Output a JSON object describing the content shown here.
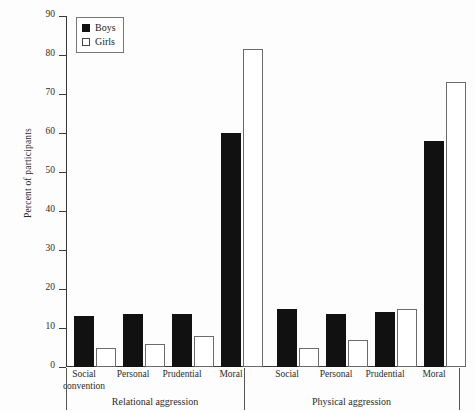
{
  "chart_data": {
    "type": "bar",
    "title": "",
    "xlabel": "",
    "ylabel": "Percent of participants",
    "ylim": [
      0,
      90
    ],
    "yticks": [
      0,
      10,
      20,
      30,
      40,
      50,
      60,
      70,
      80,
      90
    ],
    "grid": false,
    "legend_position": "top-left",
    "categories": [
      "Social convention",
      "Personal",
      "Prudential",
      "Moral",
      "Social convention",
      "Personal",
      "Prudential",
      "Moral"
    ],
    "group_labels": [
      "Relational aggression",
      "Physical aggression"
    ],
    "series": [
      {
        "name": "Boys",
        "color": "#111111",
        "values": [
          13,
          13.5,
          13.5,
          60,
          15,
          13.5,
          14,
          58
        ]
      },
      {
        "name": "Girls",
        "color": "#ffffff",
        "values": [
          4.8,
          6,
          8,
          81.5,
          4.8,
          7,
          15,
          73
        ]
      }
    ],
    "panels": [
      {
        "label": "Relational aggression",
        "categories": [
          "Social convention",
          "Personal",
          "Prudential",
          "Moral"
        ],
        "boys": [
          13,
          13.5,
          13.5,
          60
        ],
        "girls": [
          4.8,
          6,
          8,
          81.5
        ]
      },
      {
        "label": "Physical aggression",
        "categories": [
          "Social convention",
          "Personal",
          "Prudential",
          "Moral"
        ],
        "boys": [
          15,
          13.5,
          14,
          58
        ],
        "girls": [
          4.8,
          7,
          15,
          73
        ]
      }
    ]
  },
  "axis": {
    "y_title": "Percent of participants",
    "y_ticks": [
      "90",
      "80",
      "70",
      "60",
      "50",
      "40",
      "30",
      "20",
      "10",
      "0"
    ]
  },
  "legend": {
    "items": [
      {
        "label": "Boys",
        "swatch": "filled-square-icon"
      },
      {
        "label": "Girls",
        "swatch": "hollow-square-icon"
      }
    ]
  },
  "categories": [
    {
      "line1": "Social",
      "line2": "convention"
    },
    {
      "line1": "Personal",
      "line2": ""
    },
    {
      "line1": "Prudential",
      "line2": ""
    },
    {
      "line1": "Moral",
      "line2": ""
    },
    {
      "line1": "Social",
      "line2": "convention"
    },
    {
      "line1": "Personal",
      "line2": ""
    },
    {
      "line1": "Prudential",
      "line2": ""
    },
    {
      "line1": "Moral",
      "line2": ""
    }
  ],
  "groups": [
    {
      "label": "Relational aggression"
    },
    {
      "label": "Physical aggression"
    }
  ]
}
